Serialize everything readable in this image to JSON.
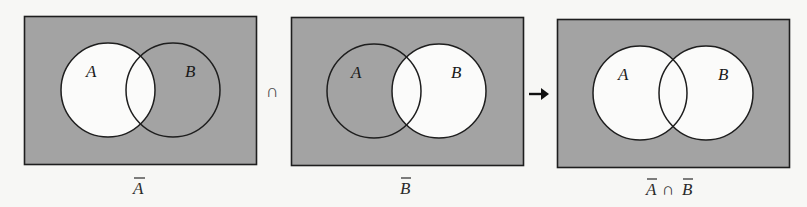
{
  "diagram": {
    "colors": {
      "background": "#f7f7f5",
      "shaded": "#a3a3a3",
      "unshaded": "#fbfbfa",
      "stroke": "#1e1e1e"
    },
    "operator_between_1_2": "∩",
    "operator_between_2_3": "→",
    "panels": [
      {
        "id": "complement-a",
        "circle_a_label": "A",
        "circle_b_label": "B",
        "caption_parts": [
          "A"
        ],
        "caption_connector": "",
        "shaded_region": "everything except A",
        "unshaded_region": "A"
      },
      {
        "id": "complement-b",
        "circle_a_label": "A",
        "circle_b_label": "B",
        "caption_parts": [
          "B"
        ],
        "caption_connector": "",
        "shaded_region": "everything except B",
        "unshaded_region": "B"
      },
      {
        "id": "complement-a-intersect-complement-b",
        "circle_a_label": "A",
        "circle_b_label": "B",
        "caption_parts": [
          "A",
          "B"
        ],
        "caption_connector": "∩",
        "shaded_region": "outside A and outside B",
        "unshaded_region": "A ∪ B"
      }
    ]
  }
}
